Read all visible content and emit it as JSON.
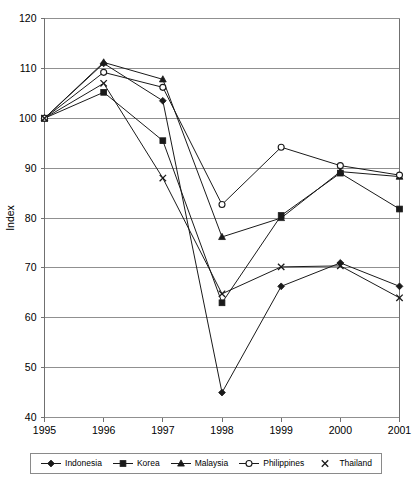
{
  "chart_data": {
    "type": "line",
    "title": "",
    "xlabel": "",
    "ylabel": "Index",
    "x": [
      "1995",
      "1996",
      "1997",
      "1998",
      "1999",
      "2000",
      "2001"
    ],
    "categories": [
      "1995",
      "1996",
      "1997",
      "1998",
      "1999",
      "2000",
      "2001"
    ],
    "xlim": [
      1995,
      2001
    ],
    "ylim": [
      40,
      120
    ],
    "yticks": [
      40,
      50,
      60,
      70,
      80,
      90,
      100,
      110,
      120
    ],
    "ytick_labels": [
      "40",
      "50",
      "60",
      "70",
      "80",
      "90",
      "100",
      "110",
      "120"
    ],
    "xtick_labels": [
      "1995",
      "1996",
      "1997",
      "1998",
      "1999",
      "2000",
      "2001"
    ],
    "grid": "horizontal",
    "legend_position": "bottom",
    "series": [
      {
        "name": "Indonesia",
        "marker": "filled-diamond",
        "color": "#1a1a1a",
        "values": [
          100,
          111,
          103.5,
          45,
          66.3,
          71,
          66.3
        ]
      },
      {
        "name": "Korea",
        "marker": "filled-square",
        "color": "#1a1a1a",
        "values": [
          100,
          105.2,
          95.5,
          63,
          80.5,
          89,
          81.8
        ]
      },
      {
        "name": "Malaysia",
        "marker": "filled-triangle",
        "color": "#1a1a1a",
        "values": [
          100,
          111.2,
          107.8,
          76.2,
          80,
          89.3,
          88.3
        ]
      },
      {
        "name": "Philippines",
        "marker": "open-circle",
        "color": "#1a1a1a",
        "values": [
          100,
          109.2,
          106.2,
          82.7,
          94.2,
          90.5,
          88.6
        ]
      },
      {
        "name": "Thailand",
        "marker": "cross-x",
        "color": "#1a1a1a",
        "values": [
          100,
          107,
          88,
          64.8,
          70.2,
          70.4,
          64
        ]
      }
    ]
  },
  "legend": {
    "items": [
      {
        "label": "Indonesia",
        "marker": "filled-diamond"
      },
      {
        "label": "Korea",
        "marker": "filled-square"
      },
      {
        "label": "Malaysia",
        "marker": "filled-triangle"
      },
      {
        "label": "Philippines",
        "marker": "open-circle"
      },
      {
        "label": "Thailand",
        "marker": "cross-x"
      }
    ]
  },
  "axes": {
    "y_title": "Index"
  }
}
